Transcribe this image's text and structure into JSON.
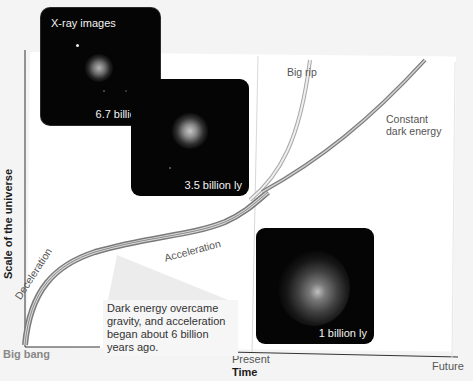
{
  "diagram": {
    "type": "conceptual-plot",
    "y_axis_title": "Scale of the universe",
    "x_axis_title": "Time",
    "x_ticks": {
      "start": "Big bang",
      "middle": "Present",
      "end": "Future"
    },
    "curve_labels": {
      "deceleration": "Deceleration",
      "acceleration": "Acceleration",
      "big_rip": "Big rip",
      "constant_dark_energy_line1": "Constant",
      "constant_dark_energy_line2": "dark energy"
    },
    "callout": {
      "text": "Dark energy overcame gravity, and acceleration began about 6 billion years ago."
    },
    "xray_images": {
      "title": "X-ray images",
      "items": [
        {
          "caption": "6.7 billion ly"
        },
        {
          "caption": "3.5 billion ly"
        },
        {
          "caption": "1 billion ly"
        }
      ]
    },
    "colors": {
      "background": "#ffffff",
      "curve": "#8a8a8a",
      "curve_light": "#bdbdbd",
      "image_bg": "#050505",
      "text_dark": "#1a1a1a",
      "text_mid": "#555555"
    }
  }
}
